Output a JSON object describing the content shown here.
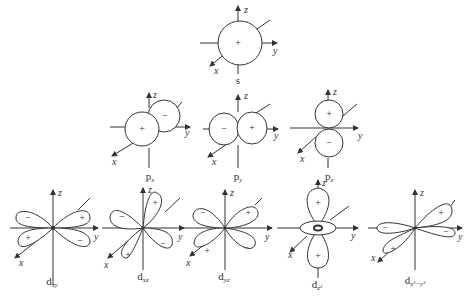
{
  "axes": {
    "x": "x",
    "y": "y",
    "z": "z"
  },
  "signs": {
    "plus": "+",
    "minus": "−"
  },
  "orbitals": [
    {
      "id": "s",
      "label": "s",
      "sub": "",
      "lobes": [
        "+"
      ]
    },
    {
      "id": "px",
      "label": "p",
      "sub": "x",
      "lobes": [
        "+",
        "−"
      ]
    },
    {
      "id": "py",
      "label": "p",
      "sub": "y",
      "lobes": [
        "−",
        "+"
      ]
    },
    {
      "id": "pz",
      "label": "p",
      "sub": "z",
      "lobes": [
        "+",
        "−"
      ]
    },
    {
      "id": "dxy",
      "label": "d",
      "sub": "xy",
      "lobes": [
        "−",
        "+",
        "+",
        "−"
      ]
    },
    {
      "id": "dxz",
      "label": "d",
      "sub": "xz",
      "lobes": [
        "−",
        "+",
        "+",
        "−"
      ]
    },
    {
      "id": "dyz",
      "label": "d",
      "sub": "yz",
      "lobes": [
        "−",
        "+",
        "+",
        "−"
      ]
    },
    {
      "id": "dz2",
      "label": "d",
      "sub": "z²",
      "lobes": [
        "+",
        "+"
      ]
    },
    {
      "id": "dx2y2",
      "label": "d",
      "sub": "x²−y²",
      "lobes": [
        "+",
        "−",
        "−",
        "+"
      ]
    }
  ]
}
